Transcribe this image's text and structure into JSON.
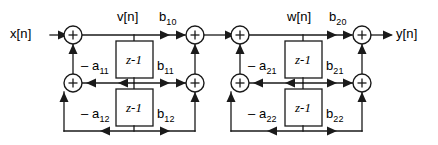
{
  "diagram": {
    "type": "signal-flow-graph",
    "canvas": {
      "width": 438,
      "height": 145
    },
    "colors": {
      "line": "#1a1a1a",
      "background": "#ffffff",
      "text": "#000000"
    },
    "io": {
      "input_label": "x[n]",
      "output_label": "y[n]"
    },
    "intermediate_nodes": [
      {
        "name": "v-node-label",
        "label": "v[n]"
      },
      {
        "name": "w-node-label",
        "label": "w[n]"
      }
    ],
    "sections": [
      {
        "name": "section-1",
        "feedback_coefficients": [
          {
            "name": "a11",
            "text": "– a",
            "sub": "11"
          },
          {
            "name": "a12",
            "text": "– a",
            "sub": "12"
          }
        ],
        "feedforward_coefficients": [
          {
            "name": "b10",
            "text": "b",
            "sub": "10"
          },
          {
            "name": "b11",
            "text": "b",
            "sub": "11"
          },
          {
            "name": "b12",
            "text": "b",
            "sub": "12"
          }
        ],
        "delays": [
          {
            "name": "delay-1-1",
            "text": "z",
            "sup": "-1"
          },
          {
            "name": "delay-1-2",
            "text": "z",
            "sup": "-1"
          }
        ],
        "adders": [
          "sum-1-top",
          "sum-1-mid",
          "sum-2-top",
          "sum-2-mid"
        ]
      },
      {
        "name": "section-2",
        "feedback_coefficients": [
          {
            "name": "a21",
            "text": "– a",
            "sub": "21"
          },
          {
            "name": "a22",
            "text": "– a",
            "sub": "22"
          }
        ],
        "feedforward_coefficients": [
          {
            "name": "b20",
            "text": "b",
            "sub": "20"
          },
          {
            "name": "b21",
            "text": "b",
            "sub": "21"
          },
          {
            "name": "b22",
            "text": "b",
            "sub": "22"
          }
        ],
        "delays": [
          {
            "name": "delay-2-1",
            "text": "z",
            "sup": "-1"
          },
          {
            "name": "delay-2-2",
            "text": "z",
            "sup": "-1"
          }
        ],
        "adders": [
          "sum-3-top",
          "sum-3-mid",
          "sum-4-top",
          "sum-4-mid"
        ]
      }
    ],
    "adder_symbol": "+"
  }
}
